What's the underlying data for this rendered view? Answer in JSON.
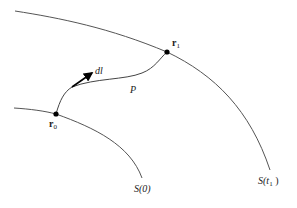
{
  "diagram": {
    "curves": [
      {
        "id": "S_t1",
        "label_main": "S(",
        "label_var": "t",
        "label_sub": "1",
        "label_close": " )"
      },
      {
        "id": "S_0",
        "label": "S(0)"
      }
    ],
    "points": [
      {
        "id": "r0",
        "label_main": "r",
        "label_sub": "0"
      },
      {
        "id": "r1",
        "label_main": "r",
        "label_sub": "1"
      }
    ],
    "path_label": "P",
    "vector_label": "dl",
    "colors": {
      "line": "#555555",
      "point": "#000000",
      "text": "#222222"
    }
  }
}
